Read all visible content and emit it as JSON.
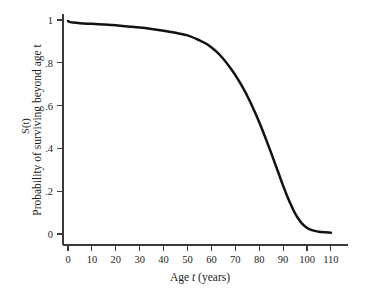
{
  "figure": {
    "background_color": "#ffffff",
    "curve_color": "#121212",
    "axis_color": "#3a3a3a",
    "text_color": "#1c1c1c"
  },
  "labels": {
    "xlabel_prefix": "Age ",
    "xlabel_italic": "t",
    "xlabel_suffix": " (years)",
    "ylabel_short_prefix": "S(",
    "ylabel_short_italic": "t",
    "ylabel_short_suffix": ")",
    "ylabel_long_prefix": "Probability of surviving beyond age ",
    "ylabel_long_italic": "t"
  },
  "chart_data": {
    "type": "line",
    "title": "",
    "subtitle": "",
    "xlabel": "Age t (years)",
    "ylabel": "S(t)  Probability of surviving beyond age t",
    "xlim": [
      0,
      110
    ],
    "ylim": [
      0,
      1
    ],
    "grid": false,
    "legend": "none",
    "xticks": [
      0,
      10,
      20,
      30,
      40,
      50,
      60,
      70,
      80,
      90,
      100,
      110
    ],
    "xticklabels": [
      "0",
      "10",
      "20",
      "30",
      "40",
      "50",
      "60",
      "70",
      "80",
      "90",
      "100",
      "110"
    ],
    "yticks": [
      0,
      0.2,
      0.4,
      0.6,
      0.8,
      1
    ],
    "yticklabels": [
      "0",
      ".2",
      ".4",
      ".6",
      ".8",
      "1"
    ],
    "series": [
      {
        "name": "Survival function S(t)",
        "x": [
          0,
          1,
          2,
          5,
          10,
          15,
          20,
          25,
          30,
          35,
          40,
          45,
          50,
          55,
          58,
          60,
          62,
          65,
          68,
          70,
          72,
          75,
          78,
          80,
          82,
          85,
          88,
          90,
          92,
          94,
          95,
          96,
          98,
          100,
          102,
          105,
          110
        ],
        "values": [
          0.995,
          0.99,
          0.988,
          0.985,
          0.982,
          0.979,
          0.975,
          0.97,
          0.965,
          0.958,
          0.95,
          0.94,
          0.928,
          0.905,
          0.888,
          0.872,
          0.853,
          0.818,
          0.775,
          0.742,
          0.706,
          0.645,
          0.574,
          0.522,
          0.466,
          0.378,
          0.286,
          0.225,
          0.168,
          0.118,
          0.096,
          0.077,
          0.047,
          0.028,
          0.018,
          0.01,
          0.006
        ]
      }
    ]
  },
  "geometry": {
    "plot_left": 63,
    "plot_right": 348,
    "plot_bottom": 245,
    "x_zero": 68,
    "x_max_px": 331,
    "y_zero": 234,
    "y_one": 20
  }
}
